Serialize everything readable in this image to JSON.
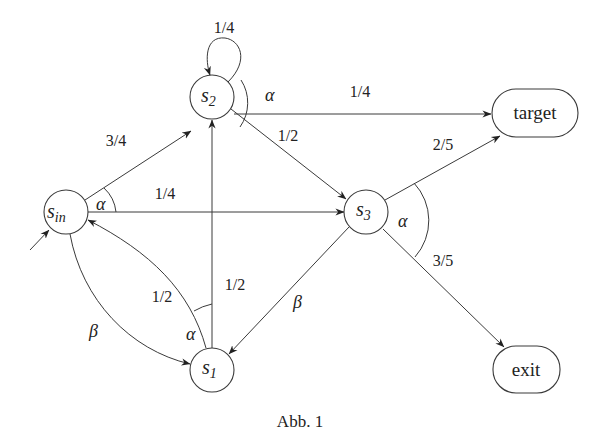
{
  "caption": "Abb. 1",
  "nodes": {
    "s_in": {
      "name": "s",
      "sub": "in",
      "cx": 66,
      "cy": 212,
      "r": 22
    },
    "s1": {
      "name": "s",
      "sub": "1",
      "cx": 212,
      "cy": 370,
      "r": 22
    },
    "s2": {
      "name": "s",
      "sub": "2",
      "cx": 212,
      "cy": 97,
      "r": 22
    },
    "s3": {
      "name": "s",
      "sub": "3",
      "cx": 366,
      "cy": 212,
      "r": 22
    },
    "target": {
      "label": "target",
      "x": 492,
      "y": 89,
      "w": 86,
      "h": 48
    },
    "exit": {
      "label": "exit",
      "x": 493,
      "y": 346,
      "w": 67,
      "h": 47
    }
  },
  "edges": [
    {
      "from": "start",
      "to": "s_in",
      "label": ""
    },
    {
      "from": "s_in",
      "to": "s2",
      "label": "3/4"
    },
    {
      "from": "s_in",
      "to": "s3",
      "label": "1/4"
    },
    {
      "from": "s_in",
      "to": "s1",
      "label": "β"
    },
    {
      "from": "s1",
      "to": "s_in",
      "label": "1/2"
    },
    {
      "from": "s1",
      "to": "s2",
      "label": "1/2"
    },
    {
      "from": "s2",
      "to": "s2",
      "label": "1/4"
    },
    {
      "from": "s2",
      "to": "target",
      "label": "1/4"
    },
    {
      "from": "s2",
      "to": "s3",
      "label": "1/2"
    },
    {
      "from": "s3",
      "to": "target",
      "label": "2/5"
    },
    {
      "from": "s3",
      "to": "exit",
      "label": "3/5"
    },
    {
      "from": "s3",
      "to": "s1",
      "label": "β"
    }
  ],
  "action_groups": [
    {
      "state": "s_in",
      "symbol": "α"
    },
    {
      "state": "s1",
      "symbol": "α"
    },
    {
      "state": "s2",
      "symbol": "α"
    },
    {
      "state": "s3",
      "symbol": "α"
    }
  ],
  "labels": {
    "s2_self": "1/4",
    "s2_target": "1/4",
    "s2_s3": "1/2",
    "sin_s2": "3/4",
    "sin_s3": "1/4",
    "s1_sin": "1/2",
    "s1_s2": "1/2",
    "s3_target": "2/5",
    "s3_exit": "3/5",
    "sin_s1": "β",
    "s3_s1": "β",
    "alpha": "α"
  }
}
